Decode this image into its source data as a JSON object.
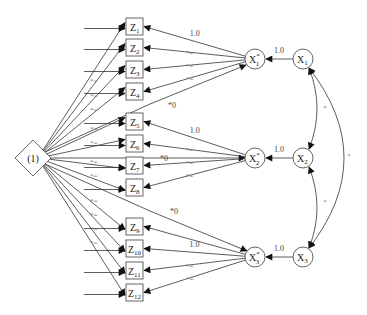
{
  "diagram": {
    "type": "path diagram (structural equation model)",
    "constant_node": {
      "id": "C",
      "label": "(1)",
      "shape": "diamond",
      "x": 33,
      "y": 158
    },
    "indicators": [
      {
        "id": "Z1",
        "base": "Z",
        "sub": "1",
        "x": 126,
        "y": 18
      },
      {
        "id": "Z2",
        "base": "Z",
        "sub": "2",
        "x": 126,
        "y": 39
      },
      {
        "id": "Z3",
        "base": "Z",
        "sub": "3",
        "x": 126,
        "y": 61
      },
      {
        "id": "Z4",
        "base": "Z",
        "sub": "4",
        "x": 126,
        "y": 83
      },
      {
        "id": "Z5",
        "base": "Z",
        "sub": "5",
        "x": 126,
        "y": 113
      },
      {
        "id": "Z6",
        "base": "Z",
        "sub": "6",
        "x": 126,
        "y": 135
      },
      {
        "id": "Z7",
        "base": "Z",
        "sub": "7",
        "x": 126,
        "y": 157
      },
      {
        "id": "Z8",
        "base": "Z",
        "sub": "8",
        "x": 126,
        "y": 179
      },
      {
        "id": "Z9",
        "base": "Z",
        "sub": "9",
        "x": 126,
        "y": 218
      },
      {
        "id": "Z10",
        "base": "Z",
        "sub": "10",
        "x": 126,
        "y": 240
      },
      {
        "id": "Z11",
        "base": "Z",
        "sub": "11",
        "x": 126,
        "y": 262
      },
      {
        "id": "Z12",
        "base": "Z",
        "sub": "12",
        "x": 126,
        "y": 284
      }
    ],
    "latent_star": [
      {
        "id": "X1s",
        "base": "X",
        "sub": "1",
        "sup": "*",
        "cx": 255,
        "cy": 59
      },
      {
        "id": "X2s",
        "base": "X",
        "sub": "2",
        "sup": "*",
        "cx": 255,
        "cy": 158
      },
      {
        "id": "X3s",
        "base": "X",
        "sub": "3",
        "sup": "*",
        "cx": 255,
        "cy": 257
      }
    ],
    "latent": [
      {
        "id": "X1",
        "base": "X",
        "sub": "1",
        "cx": 303,
        "cy": 59
      },
      {
        "id": "X2",
        "base": "X",
        "sub": "2",
        "cx": 303,
        "cy": 158
      },
      {
        "id": "X3",
        "base": "X",
        "sub": "3",
        "cx": 303,
        "cy": 257
      }
    ],
    "loading_labels": {
      "fixed": "1.0",
      "free_equal": "*=",
      "zero": "*0",
      "free": "*"
    },
    "paths": {
      "X_to_Xstar": [
        {
          "from": "X1",
          "to": "X1s",
          "label": "1.0"
        },
        {
          "from": "X2",
          "to": "X2s",
          "label": "1.0"
        },
        {
          "from": "X3",
          "to": "X3s",
          "label": "1.0"
        }
      ],
      "Xstar_to_Z": [
        {
          "from": "X1s",
          "to": "Z1",
          "label": "1.0"
        },
        {
          "from": "X1s",
          "to": "Z2",
          "label": "*="
        },
        {
          "from": "X1s",
          "to": "Z3",
          "label": "*="
        },
        {
          "from": "X1s",
          "to": "Z4",
          "label": "*="
        },
        {
          "from": "X2s",
          "to": "Z5",
          "label": "1.0"
        },
        {
          "from": "X2s",
          "to": "Z6",
          "label": "*="
        },
        {
          "from": "X2s",
          "to": "Z7",
          "label": "*="
        },
        {
          "from": "X2s",
          "to": "Z8",
          "label": "*="
        },
        {
          "from": "X3s",
          "to": "Z9",
          "label": ""
        },
        {
          "from": "X3s",
          "to": "Z10",
          "label": "1.0"
        },
        {
          "from": "X3s",
          "to": "Z11",
          "label": "*="
        },
        {
          "from": "X3s",
          "to": "Z12",
          "label": "*="
        }
      ],
      "constant_to_Xstar": [
        {
          "from": "C",
          "to": "X1s",
          "label": "*0"
        },
        {
          "from": "C",
          "to": "X2s",
          "label": "*0"
        },
        {
          "from": "C",
          "to": "X3s",
          "label": "*0"
        }
      ],
      "constant_to_Z_labels": [
        "",
        "*=",
        "*=",
        "*=",
        "*=",
        "*=",
        "*=",
        "*=",
        "*=",
        "*=",
        "*=",
        "*="
      ],
      "covariances": [
        {
          "between": [
            "X1",
            "X2"
          ],
          "label": "*"
        },
        {
          "between": [
            "X2",
            "X3"
          ],
          "label": "*"
        },
        {
          "between": [
            "X1",
            "X3"
          ],
          "label": "*"
        }
      ]
    }
  }
}
